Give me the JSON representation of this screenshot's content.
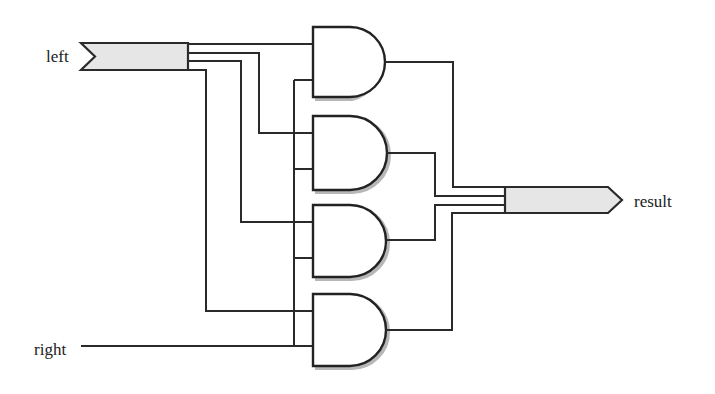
{
  "diagram": {
    "type": "logic-circuit",
    "inputs": [
      {
        "name": "left",
        "kind": "bus",
        "width": 4
      },
      {
        "name": "right",
        "kind": "wire",
        "width": 1
      }
    ],
    "outputs": [
      {
        "name": "result",
        "kind": "bus",
        "width": 4
      }
    ],
    "gates": [
      {
        "id": "and0",
        "type": "AND",
        "inputs": [
          "left[0]",
          "right"
        ],
        "output": "result[0]"
      },
      {
        "id": "and1",
        "type": "AND",
        "inputs": [
          "left[1]",
          "right"
        ],
        "output": "result[1]"
      },
      {
        "id": "and2",
        "type": "AND",
        "inputs": [
          "left[2]",
          "right"
        ],
        "output": "result[2]"
      },
      {
        "id": "and3",
        "type": "AND",
        "inputs": [
          "left[3]",
          "right"
        ],
        "output": "result[3]"
      }
    ],
    "colors": {
      "wire": "#2a2a2a",
      "bus_fill": "#e6e6e6",
      "background": "#ffffff"
    }
  },
  "labels": {
    "left": "left",
    "right": "right",
    "result": "result"
  }
}
